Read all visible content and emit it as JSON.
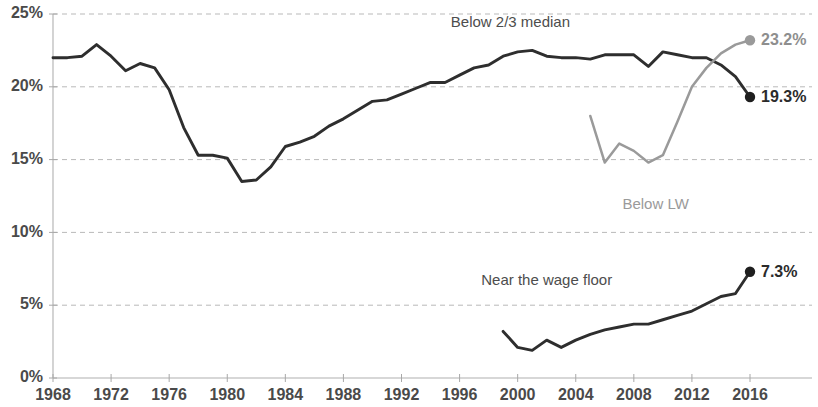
{
  "chart_data": {
    "type": "line",
    "title": "",
    "subtitle": "",
    "xlabel": "",
    "ylabel": "",
    "xlim": [
      1968,
      2016
    ],
    "ylim": [
      0,
      25
    ],
    "grid": true,
    "legend_position": "inline-annotations",
    "y_ticks": [
      "0%",
      "5%",
      "10%",
      "15%",
      "20%",
      "25%"
    ],
    "y_tick_values": [
      0,
      5,
      10,
      15,
      20,
      25
    ],
    "x_ticks": [
      "1968",
      "1972",
      "1976",
      "1980",
      "1984",
      "1988",
      "1992",
      "1996",
      "2000",
      "2004",
      "2008",
      "2012",
      "2016"
    ],
    "x_tick_values": [
      1968,
      1972,
      1976,
      1980,
      1984,
      1988,
      1992,
      1996,
      2000,
      2004,
      2008,
      2012,
      2016
    ],
    "series": [
      {
        "name": "Below 2/3 median",
        "color": "#2e2e2e",
        "style": "dark",
        "end_label": "19.3%",
        "end_value": 19.3,
        "annotation": "Below 2/3 median",
        "annotation_x": 1908,
        "x": [
          1968,
          1969,
          1970,
          1971,
          1972,
          1973,
          1974,
          1975,
          1976,
          1977,
          1978,
          1979,
          1980,
          1981,
          1982,
          1983,
          1984,
          1985,
          1986,
          1987,
          1988,
          1989,
          1990,
          1991,
          1992,
          1993,
          1994,
          1995,
          1996,
          1997,
          1998,
          1999,
          2000,
          2001,
          2002,
          2003,
          2004,
          2005,
          2006,
          2007,
          2008,
          2009,
          2010,
          2011,
          2012,
          2013,
          2014,
          2015,
          2016
        ],
        "values": [
          22.0,
          22.0,
          22.1,
          22.9,
          22.1,
          21.1,
          21.6,
          21.3,
          19.8,
          17.2,
          15.3,
          15.3,
          15.1,
          13.5,
          13.6,
          14.5,
          15.9,
          16.2,
          16.6,
          17.3,
          17.8,
          18.4,
          19.0,
          19.1,
          19.5,
          19.9,
          20.3,
          20.3,
          20.8,
          21.3,
          21.5,
          22.1,
          22.4,
          22.5,
          22.1,
          22.0,
          22.0,
          21.9,
          22.2,
          22.2,
          22.2,
          21.4,
          22.4,
          22.2,
          22.0,
          22.0,
          21.5,
          20.7,
          19.3
        ]
      },
      {
        "name": "Below LW",
        "color": "#9a9a9a",
        "style": "gray",
        "end_label": "23.2%",
        "end_value": 23.2,
        "annotation": "Below LW",
        "x": [
          2005,
          2006,
          2007,
          2008,
          2009,
          2010,
          2011,
          2012,
          2013,
          2014,
          2015,
          2016
        ],
        "values": [
          18.0,
          14.8,
          16.1,
          15.6,
          14.8,
          15.3,
          17.6,
          20.0,
          21.3,
          22.3,
          22.9,
          23.2
        ]
      },
      {
        "name": "Near the wage floor",
        "color": "#2e2e2e",
        "style": "dark",
        "end_label": "7.3%",
        "end_value": 7.3,
        "annotation": "Near the wage floor",
        "x": [
          1999,
          2000,
          2001,
          2002,
          2003,
          2004,
          2005,
          2006,
          2007,
          2008,
          2009,
          2010,
          2011,
          2012,
          2013,
          2014,
          2015,
          2016
        ],
        "values": [
          3.2,
          2.1,
          1.9,
          2.6,
          2.1,
          2.6,
          3.0,
          3.3,
          3.5,
          3.7,
          3.7,
          4.0,
          4.3,
          4.6,
          5.1,
          5.6,
          5.8,
          7.3
        ]
      }
    ],
    "annotations": [
      {
        "text": "Below 2/3 median",
        "x": 1999.5,
        "y": 24.1,
        "color": "dark"
      },
      {
        "text": "Below LW",
        "x": 2009.5,
        "y": 11.6,
        "color": "gray"
      },
      {
        "text": "Near the wage floor",
        "x": 2002.0,
        "y": 6.4,
        "color": "dark"
      }
    ]
  }
}
